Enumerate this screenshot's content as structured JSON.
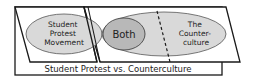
{
  "title": "Student Protest vs. Counterculture",
  "regions": {
    "left": {
      "lines": [
        "Student",
        "Protest",
        "Movement"
      ]
    },
    "center": {
      "label": "Both"
    },
    "right": {
      "lines": [
        "The",
        "Counter-",
        "culture"
      ]
    }
  },
  "colors": {
    "background": "#ffffff",
    "outline": "#1a1a1a",
    "ellipse_fill": "#d9d9d9",
    "overlap_fill": "#b8b8b8",
    "text": "#222222"
  }
}
